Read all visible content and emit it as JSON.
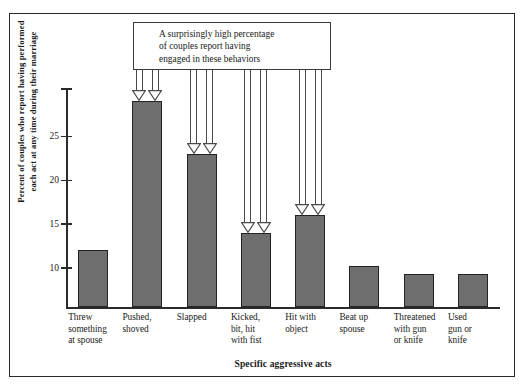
{
  "figure": {
    "frame": true,
    "background_color": "#ffffff"
  },
  "annotation": {
    "name": "callout-box",
    "lines": [
      "A surprisingly high percentage",
      "of couples report having",
      "engaged in these behaviors"
    ],
    "arrow_targets": [
      "Pushed, shoved",
      "Slapped",
      "Kicked, bit, hit with fist",
      "Hit with object"
    ]
  },
  "chart_data": {
    "type": "bar",
    "title": "",
    "xlabel": "Specific aggressive acts",
    "ylabel": "Percent of couples who report having performed each act at any time during their marriage",
    "ylabel_lines": [
      "Percent of couples who report having performed",
      "each act at any time during their marriage"
    ],
    "categories": [
      "Threw something at spouse",
      "Pushed, shoved",
      "Slapped",
      "Kicked, bit, hit with fist",
      "Hit with object",
      "Beat up spouse",
      "Threatened with gun or knife",
      "Used gun or knife"
    ],
    "category_lines": [
      [
        "Threw",
        "something",
        "at spouse"
      ],
      [
        "Pushed,",
        "shoved"
      ],
      [
        "Slapped"
      ],
      [
        "Kicked,",
        "bit, hit",
        "with fist"
      ],
      [
        "Hit with",
        "object"
      ],
      [
        "Beat up",
        "spouse"
      ],
      [
        "Threatened",
        "with gun",
        "or knife"
      ],
      [
        "Used",
        "gun or",
        "knife"
      ]
    ],
    "values": [
      12.1,
      29.0,
      23.0,
      14.0,
      16.0,
      10.2,
      9.3,
      9.3
    ],
    "yticks": [
      10,
      15,
      20,
      25
    ],
    "ytick_labels": [
      "10",
      "15",
      "20",
      "25"
    ],
    "ylim": [
      5.5,
      30.4
    ],
    "grid": false,
    "legend": false,
    "bar_color": "#6e6e6e",
    "bar_edge_color": "#232323",
    "axis_color": "#2b2b2b"
  }
}
